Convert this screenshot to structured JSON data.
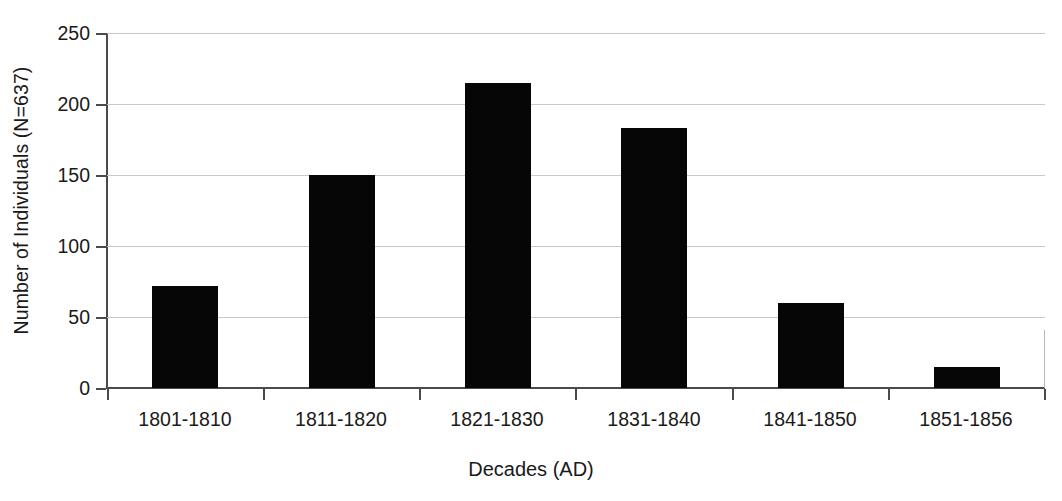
{
  "chart_data": {
    "type": "bar",
    "title": "",
    "subtitle": "",
    "xlabel": "Decades (AD)",
    "ylabel": "Number of Individuals (N=637)",
    "categories": [
      "1801-1810",
      "1811-1820",
      "1821-1830",
      "1831-1840",
      "1841-1850",
      "1851-1856"
    ],
    "values": [
      72,
      150,
      215,
      183,
      60,
      15
    ],
    "series": [
      {
        "name": "Number of Individuals",
        "values": [
          72,
          150,
          215,
          183,
          60,
          15
        ]
      }
    ],
    "ylim": [
      0,
      250
    ],
    "yticks": [
      0,
      50,
      100,
      150,
      200,
      250
    ],
    "ytick_labels": [
      "0",
      "50",
      "100",
      "150",
      "200",
      "250"
    ],
    "grid": "horizontal",
    "legend": "none",
    "bar_color": "#060606",
    "gridline_color": "#c9c9c9",
    "axis_color": "#4a4a4a",
    "background_color": "#ffffff",
    "annotations": []
  }
}
